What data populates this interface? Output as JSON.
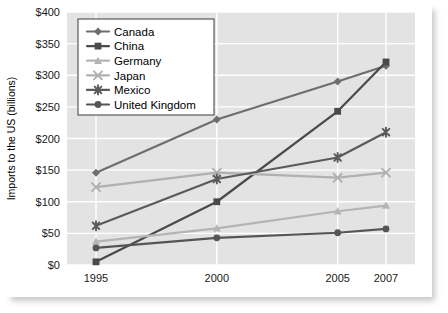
{
  "chart_data": {
    "type": "line",
    "title": "",
    "xlabel": "",
    "ylabel": "Imports to the US (billions)",
    "categories": [
      "1995",
      "2000",
      "2005",
      "2007"
    ],
    "x_positions": [
      0,
      5,
      10,
      12
    ],
    "xlim": [
      -1.2,
      13.2
    ],
    "ylim": [
      0,
      400
    ],
    "y_ticks": [
      0,
      50,
      100,
      150,
      200,
      250,
      300,
      350,
      400
    ],
    "y_tick_labels": [
      "$0",
      "$50",
      "$100",
      "$150",
      "$200",
      "$250",
      "$300",
      "$350",
      "$400"
    ],
    "grid": "horizontal-and-vertical",
    "legend_position": "top-left-inside",
    "series": [
      {
        "name": "Canada",
        "marker": "diamond",
        "color": "#6e6e6e",
        "values": [
          146,
          230,
          290,
          315
        ]
      },
      {
        "name": "China",
        "marker": "square",
        "color": "#4a4a4a",
        "values": [
          5,
          100,
          243,
          321
        ]
      },
      {
        "name": "Germany",
        "marker": "triangle",
        "color": "#b4b4b4",
        "values": [
          37,
          58,
          85,
          94
        ]
      },
      {
        "name": "Japan",
        "marker": "cross",
        "color": "#b0b0b0",
        "values": [
          123,
          146,
          138,
          146
        ]
      },
      {
        "name": "Mexico",
        "marker": "asterisk",
        "color": "#5a5a5a",
        "values": [
          62,
          136,
          170,
          210
        ]
      },
      {
        "name": "United Kingdom",
        "marker": "circle",
        "color": "#555555",
        "values": [
          27,
          43,
          51,
          57
        ]
      }
    ]
  },
  "legend": {
    "items": [
      {
        "label": "Canada"
      },
      {
        "label": "China"
      },
      {
        "label": "Germany"
      },
      {
        "label": "Japan"
      },
      {
        "label": "Mexico"
      },
      {
        "label": "United Kingdom"
      }
    ]
  },
  "colors": {
    "plot_background": "#e3e3e3",
    "gridline": "#ffffff",
    "page_background": "#ffffff",
    "text": "#000000"
  }
}
